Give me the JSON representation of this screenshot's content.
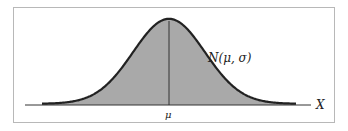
{
  "chart_data": {
    "type": "area",
    "title": "",
    "curve_label": "N(μ, σ)",
    "xlabel": "X",
    "mean_label": "μ",
    "xlim": [
      -3.5,
      3.5
    ],
    "ylim": [
      0,
      0.4
    ],
    "x": [
      -3.5,
      -3,
      -2.5,
      -2,
      -1.5,
      -1,
      -0.5,
      0,
      0.5,
      1,
      1.5,
      2,
      2.5,
      3,
      3.5
    ],
    "values": [
      0.001,
      0.004,
      0.018,
      0.054,
      0.13,
      0.242,
      0.352,
      0.399,
      0.352,
      0.242,
      0.13,
      0.054,
      0.018,
      0.004,
      0.001
    ],
    "grid": false,
    "colors": {
      "fill": "#a9a9a9",
      "curve": "#222222",
      "axis": "#333333",
      "border": "#b8b8b8"
    }
  },
  "labels": {
    "curve": "N(μ, σ)",
    "axis": "X",
    "mean": "μ"
  }
}
